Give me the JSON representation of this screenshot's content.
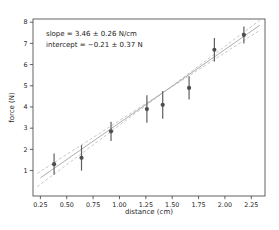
{
  "figure": {
    "background": "#ffffff",
    "annotation": {
      "line1": "slope = 3.46 ± 0.26 N/cm",
      "line2": "intercept = −0.21 ± 0.37 N"
    }
  },
  "chart_data": {
    "type": "scatter",
    "title": "",
    "xlabel": "distance (cm)",
    "ylabel": "force (N)",
    "xlim": [
      0.18,
      2.38
    ],
    "ylim": [
      -0.2,
      8.15
    ],
    "grid": false,
    "legend": "none",
    "x_ticks": [
      0.25,
      0.5,
      0.75,
      1.0,
      1.25,
      1.5,
      1.75,
      2.0,
      2.25
    ],
    "x_tick_labels": [
      "0.25",
      "0.50",
      "0.75",
      "1.00",
      "1.25",
      "1.50",
      "1.75",
      "2.00",
      "2.25"
    ],
    "y_ticks": [
      1,
      2,
      3,
      4,
      5,
      6,
      7,
      8
    ],
    "y_tick_labels": [
      "1",
      "2",
      "3",
      "4",
      "5",
      "6",
      "7",
      "8"
    ],
    "points": {
      "x": [
        0.38,
        0.64,
        0.92,
        1.26,
        1.41,
        1.66,
        1.9,
        2.18
      ],
      "y": [
        1.3,
        1.6,
        2.85,
        3.9,
        4.1,
        4.9,
        6.7,
        7.4
      ],
      "yerr": [
        0.5,
        0.6,
        0.45,
        0.65,
        0.65,
        0.55,
        0.55,
        0.4
      ]
    },
    "fit_line": {
      "slope": 3.46,
      "intercept": -0.21,
      "x_range": [
        0.25,
        2.33
      ],
      "style": "solid"
    },
    "confidence_lines": [
      {
        "slope": 3.72,
        "intercept": -0.58,
        "x_range": [
          0.22,
          2.33
        ],
        "style": "dashed"
      },
      {
        "slope": 3.2,
        "intercept": 0.16,
        "x_range": [
          0.22,
          2.33
        ],
        "style": "dashed"
      }
    ],
    "colors": {
      "point": "#4d4d4d",
      "error_bar": "#5f5f5f",
      "fit_line": "#adadad",
      "confidence_line": "#c9c9c9",
      "spine": "#3c3c3c",
      "tick_label": "#262626"
    }
  }
}
